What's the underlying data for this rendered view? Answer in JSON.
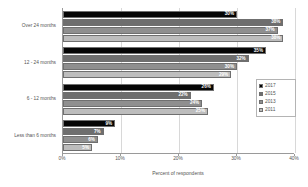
{
  "chart_data": {
    "type": "bar",
    "orientation": "horizontal",
    "title": "",
    "xlabel": "Percent of respondents",
    "ylabel": "",
    "xlim": [
      0,
      40
    ],
    "xtick_labels": [
      "0%",
      "10%",
      "20%",
      "30%",
      "40%"
    ],
    "xticks": [
      0,
      10,
      20,
      30,
      40
    ],
    "grid": true,
    "legend_position": "right",
    "categories": [
      "Over 24 months",
      "12 - 24 months",
      "6 - 12 months",
      "Less than 6 months"
    ],
    "series": [
      {
        "name": "2017",
        "color": "#050505",
        "values": [
          30,
          35,
          26,
          9
        ],
        "labels": [
          "30%",
          "35%",
          "26%",
          "9%"
        ]
      },
      {
        "name": "2015",
        "color": "#6e6e6e",
        "values": [
          38,
          32,
          22,
          7
        ],
        "labels": [
          "38%",
          "32%",
          "22%",
          "7%"
        ]
      },
      {
        "name": "2013",
        "color": "#8f8f8f",
        "values": [
          37,
          30,
          24,
          6
        ],
        "labels": [
          "37%",
          "30%",
          "24%",
          "6%"
        ]
      },
      {
        "name": "2011",
        "color": "#bdbdbd",
        "values": [
          38,
          29,
          25,
          5
        ],
        "labels": [
          "38%",
          "29%",
          "25%",
          "5%"
        ]
      }
    ]
  }
}
